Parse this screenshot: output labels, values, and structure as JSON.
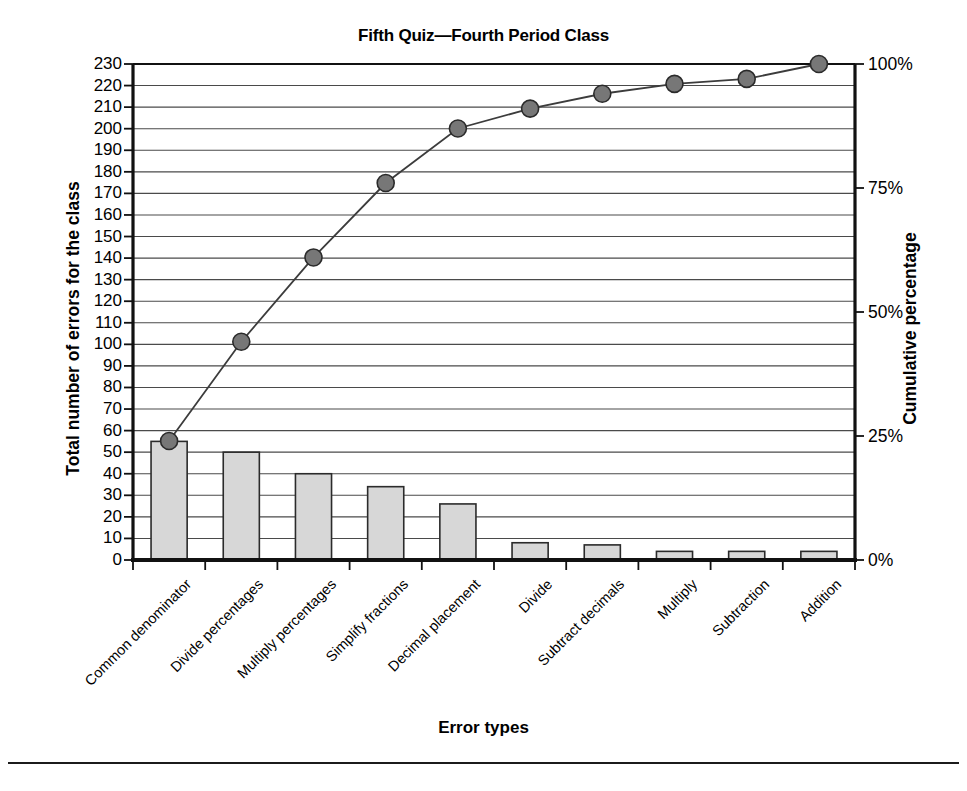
{
  "chart_data": {
    "type": "bar",
    "chart_kind": "pareto",
    "title": "Fifth Quiz—Fourth Period Class",
    "xlabel": "Error types",
    "ylabel": "Total number of errors for the class",
    "ylabel_right": "Cumulative percentage",
    "categories": [
      "Common denominator",
      "Divide percentages",
      "Multiply percentages",
      "Simplify fractions",
      "Decimal placement",
      "Divide",
      "Subtract decimals",
      "Multiply",
      "Subtraction",
      "Addition"
    ],
    "values": [
      55,
      50,
      40,
      34,
      26,
      8,
      7,
      4,
      4,
      4
    ],
    "cumulative_values": [
      55,
      101,
      139,
      173,
      200,
      208,
      215,
      219,
      223,
      229
    ],
    "cumulative_percent": [
      24,
      44,
      61,
      76,
      87,
      91,
      94,
      96,
      97,
      100
    ],
    "ylim": [
      0,
      230
    ],
    "ylim_right": [
      0,
      100
    ],
    "yticks": [
      0,
      10,
      20,
      30,
      40,
      50,
      60,
      70,
      80,
      90,
      100,
      110,
      120,
      130,
      140,
      150,
      160,
      170,
      180,
      190,
      200,
      210,
      220,
      230
    ],
    "ytick_labels": [
      "0",
      "10",
      "20",
      "30",
      "40",
      "50",
      "60",
      "70",
      "80",
      "90",
      "100",
      "110",
      "120",
      "130",
      "140",
      "150",
      "160",
      "170",
      "180",
      "190",
      "200",
      "210",
      "220",
      "230"
    ],
    "yticks_right": [
      0,
      25,
      50,
      75,
      100
    ],
    "ytick_labels_right": [
      "0%",
      "25%",
      "50%",
      "75%",
      "100%"
    ],
    "grid": true,
    "legend": "none",
    "series": [
      {
        "name": "Total number of errors for the class",
        "type": "bar",
        "values": [
          55,
          50,
          40,
          34,
          26,
          8,
          7,
          4,
          4,
          4
        ]
      },
      {
        "name": "Cumulative percentage",
        "type": "line",
        "values": [
          24,
          44,
          61,
          76,
          87,
          91,
          94,
          96,
          97,
          100
        ]
      }
    ],
    "colors": {
      "bar_fill": "#d7d7d7",
      "bar_border": "#2b2b2b",
      "line": "#3c3c3c",
      "marker_fill": "#777777",
      "marker_border": "#2b2b2b",
      "grid": "#4a4a4a",
      "axis": "#111111",
      "text": "#000000"
    }
  }
}
